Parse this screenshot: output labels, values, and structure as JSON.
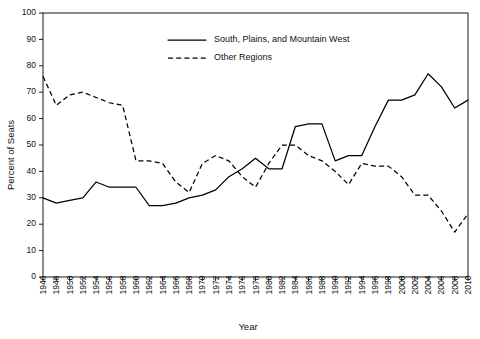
{
  "chart_data": {
    "type": "line",
    "title": "",
    "xlabel": "Year",
    "ylabel": "Percent of Seats",
    "xlim": [
      1946,
      2010
    ],
    "ylim": [
      0,
      100
    ],
    "ytick_step": 10,
    "yticks": [
      0,
      10,
      20,
      30,
      40,
      50,
      60,
      70,
      80,
      90,
      100
    ],
    "xticks": [
      1946,
      1948,
      1950,
      1952,
      1954,
      1956,
      1958,
      1960,
      1962,
      1964,
      1966,
      1968,
      1970,
      1972,
      1974,
      1976,
      1978,
      1980,
      1982,
      1984,
      1986,
      1988,
      1990,
      1992,
      1994,
      1996,
      1998,
      2000,
      2002,
      2004,
      2006,
      2008,
      2010
    ],
    "grid": false,
    "legend_position": "top-center",
    "x": [
      1946,
      1948,
      1950,
      1952,
      1954,
      1956,
      1958,
      1960,
      1962,
      1964,
      1966,
      1968,
      1970,
      1972,
      1974,
      1976,
      1978,
      1980,
      1982,
      1984,
      1986,
      1988,
      1990,
      1992,
      1994,
      1996,
      1998,
      2000,
      2002,
      2004,
      2006,
      2008,
      2010
    ],
    "series": [
      {
        "name": "South, Plains, and Mountain West",
        "style": "solid",
        "values": [
          30,
          28,
          29,
          30,
          36,
          34,
          34,
          34,
          27,
          27,
          28,
          30,
          31,
          33,
          38,
          41,
          45,
          41,
          41,
          57,
          58,
          58,
          44,
          46,
          46,
          57,
          67,
          67,
          69,
          77,
          72,
          64,
          67
        ]
      },
      {
        "name": "Other Regions",
        "style": "dashed",
        "values": [
          76,
          65,
          69,
          70,
          68,
          66,
          65,
          44,
          44,
          43,
          36,
          32,
          43,
          46,
          44,
          38,
          34,
          43,
          50,
          50,
          46,
          44,
          40,
          35,
          43,
          42,
          42,
          38,
          31,
          31,
          25,
          17,
          24
        ]
      }
    ],
    "legend": [
      {
        "label": "South, Plains, and Mountain West",
        "style": "solid"
      },
      {
        "label": "Other Regions",
        "style": "dashed"
      }
    ]
  }
}
